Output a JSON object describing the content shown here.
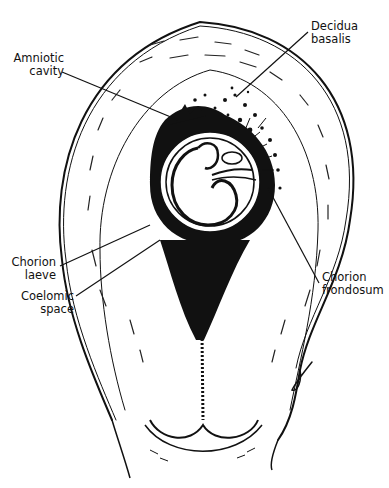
{
  "figure": {
    "colors": {
      "ink": "#111111",
      "background": "#ffffff"
    }
  },
  "labels": {
    "amniotic_cavity": {
      "line1": "Amniotic",
      "line2": "cavity"
    },
    "decidua_basalis": {
      "line1": "Decidua",
      "line2": "basalis"
    },
    "chorion_laeve": {
      "line1": "Chorion",
      "line2": "laeve"
    },
    "coelomic_space": {
      "line1": "Coelomic",
      "line2": "space"
    },
    "chorion_frondosum": {
      "line1": "Chorion",
      "line2": "frondosum"
    }
  }
}
